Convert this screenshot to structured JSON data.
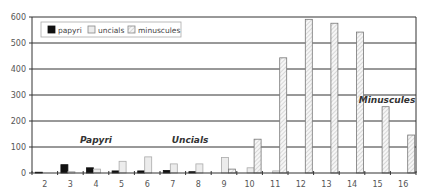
{
  "chart_data": {
    "type": "bar",
    "title": "",
    "xlabel": "",
    "ylabel": "",
    "categories": [
      "2",
      "3",
      "4",
      "5",
      "6",
      "7",
      "8",
      "9",
      "10",
      "11",
      "12",
      "13",
      "14",
      "15",
      "16"
    ],
    "series": [
      {
        "name": "papyri",
        "color": "#111111",
        "pattern": "solid",
        "values": [
          3,
          32,
          20,
          8,
          8,
          10,
          5,
          0,
          0,
          0,
          0,
          0,
          0,
          0,
          0
        ]
      },
      {
        "name": "uncials",
        "color": "#eeeeee",
        "pattern": "light",
        "values": [
          0,
          5,
          15,
          45,
          62,
          35,
          35,
          60,
          20,
          8,
          0,
          0,
          0,
          0,
          0
        ]
      },
      {
        "name": "minuscules",
        "color": "#f4f4f4",
        "pattern": "hatched",
        "values": [
          0,
          0,
          0,
          0,
          0,
          0,
          0,
          15,
          130,
          443,
          591,
          576,
          542,
          255,
          146
        ]
      }
    ],
    "ylim": [
      0,
      600
    ],
    "yticks": [
      0,
      100,
      200,
      300,
      400,
      500,
      600
    ],
    "grid": true,
    "legend_position": "top-left inside",
    "annotations": [
      {
        "text": "Papyri",
        "category": "4"
      },
      {
        "text": "Uncials",
        "category": "8"
      },
      {
        "text": "Minuscules",
        "category": "15"
      }
    ]
  },
  "legend": {
    "items": [
      {
        "label": "papyri"
      },
      {
        "label": "uncials"
      },
      {
        "label": "minuscules"
      }
    ]
  },
  "annotations": {
    "papyri": "Papyri",
    "uncials": "Uncials",
    "minuscules": "Minuscules"
  }
}
